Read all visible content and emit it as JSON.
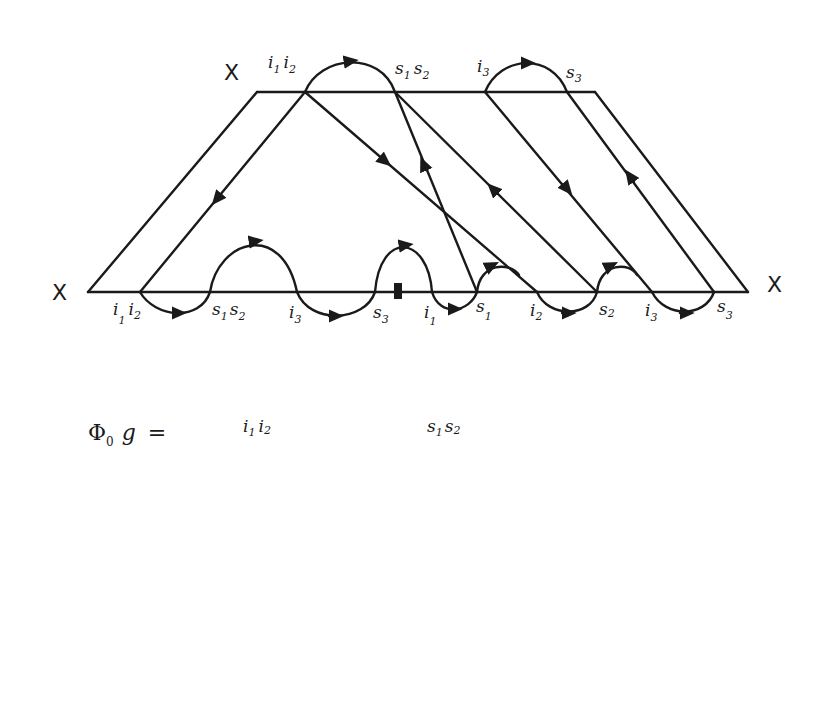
{
  "diagram": {
    "type": "hand-drawn arc diagram (braid/interval exchange)",
    "trapezoid": {
      "top_label": "X",
      "left_label": "X",
      "right_label": "X",
      "top_points": [
        {
          "label": "i",
          "sub": "1",
          "label2": "i",
          "sub2": "2",
          "id": "top-i1i2"
        },
        {
          "label": "s",
          "sub": "1",
          "label2": "s",
          "sub2": "2",
          "id": "top-s1s2"
        },
        {
          "label": "i",
          "sub": "3",
          "id": "top-i3"
        },
        {
          "label": "s",
          "sub": "3",
          "id": "top-s3"
        }
      ],
      "bottom_points": [
        {
          "label": "i",
          "sub": "1",
          "label2": "i",
          "sub2": "2"
        },
        {
          "label": "s",
          "sub": "1",
          "label2": "s",
          "sub2": "2"
        },
        {
          "label": "i",
          "sub": "3"
        },
        {
          "label": "s",
          "sub": "3"
        },
        {
          "label": "i",
          "sub": "1"
        },
        {
          "label": "s",
          "sub": "1"
        },
        {
          "label": "i",
          "sub": "2"
        },
        {
          "label": "s",
          "sub": "2"
        },
        {
          "label": "i",
          "sub": "3"
        },
        {
          "label": "s",
          "sub": "3"
        }
      ],
      "marker": "filled square on bottom edge between s3 and i1"
    },
    "equations": [
      {
        "lhs": "Φ",
        "lhs_sub": "0",
        "var": "g",
        "eq": "=",
        "terms": [
          "i1 i2 → s1 s2",
          "i3 → s3"
        ]
      },
      {
        "lhs": "Φ",
        "lhs_sub": "1",
        "var": "g",
        "eq": "=",
        "terms": [
          "i1 i2 (point)",
          "s1 s2 → i3",
          "s3 (point)"
        ]
      },
      {
        "lhs": "Φ",
        "lhs_sub": "2",
        "var": "g",
        "eq": "=",
        "terms": [
          "i1 (point)",
          "s1 → i2",
          "s2 → i3",
          "s3 (point)"
        ]
      }
    ]
  },
  "labels": {
    "X": "X",
    "i": "i",
    "s": "s",
    "n0": "0",
    "n1": "1",
    "n2": "2",
    "n3": "3",
    "phi": "Φ",
    "g": "g",
    "eq": "="
  }
}
